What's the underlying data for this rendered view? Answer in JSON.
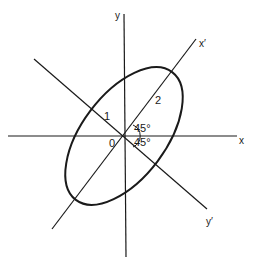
{
  "diagram": {
    "axes": {
      "x": {
        "label": "x"
      },
      "y": {
        "label": "y"
      },
      "x_prime": {
        "label": "x′"
      },
      "y_prime": {
        "label": "y′"
      }
    },
    "origin_label": "0",
    "semi_axis_labels": {
      "minor": "1",
      "major": "2"
    },
    "angle_labels": {
      "upper": "45°",
      "lower": "45°"
    },
    "rotation_degrees": 45,
    "colors": {
      "stroke": "#1a1a1a",
      "background": "#ffffff"
    }
  }
}
